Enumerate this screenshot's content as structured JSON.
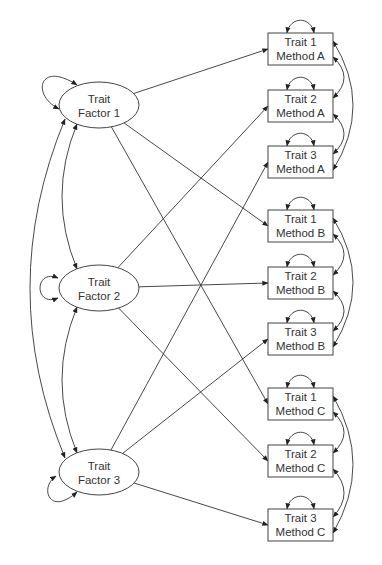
{
  "diagram": {
    "type": "multitrait-multimethod-cfa",
    "factors": [
      {
        "id": "F1",
        "line1": "Trait",
        "line2": "Factor 1",
        "cx": 99,
        "cy": 105
      },
      {
        "id": "F2",
        "line1": "Trait",
        "line2": "Factor 2",
        "cx": 99,
        "cy": 288
      },
      {
        "id": "F3",
        "line1": "Trait",
        "line2": "Factor 3",
        "cx": 99,
        "cy": 472
      }
    ],
    "indicators": [
      {
        "id": "T1A",
        "line1": "Trait 1",
        "line2": "Method A",
        "y": 33,
        "factor": "F1"
      },
      {
        "id": "T2A",
        "line1": "Trait 2",
        "line2": "Method A",
        "y": 90,
        "factor": "F2"
      },
      {
        "id": "T3A",
        "line1": "Trait 3",
        "line2": "Method A",
        "y": 146,
        "factor": "F3"
      },
      {
        "id": "T1B",
        "line1": "Trait 1",
        "line2": "Method B",
        "y": 210,
        "factor": "F1"
      },
      {
        "id": "T2B",
        "line1": "Trait 2",
        "line2": "Method B",
        "y": 267,
        "factor": "F2"
      },
      {
        "id": "T3B",
        "line1": "Trait 3",
        "line2": "Method B",
        "y": 323,
        "factor": "F3"
      },
      {
        "id": "T1C",
        "line1": "Trait 1",
        "line2": "Method C",
        "y": 388,
        "factor": "F1"
      },
      {
        "id": "T2C",
        "line1": "Trait 2",
        "line2": "Method C",
        "y": 445,
        "factor": "F2"
      },
      {
        "id": "T3C",
        "line1": "Trait 3",
        "line2": "Method C",
        "y": 509,
        "factor": "F3"
      }
    ],
    "method_groups": [
      "Method A",
      "Method B",
      "Method C"
    ],
    "colors": {
      "stroke": "#333333",
      "fill": "#ffffff",
      "text": "#333333"
    }
  }
}
